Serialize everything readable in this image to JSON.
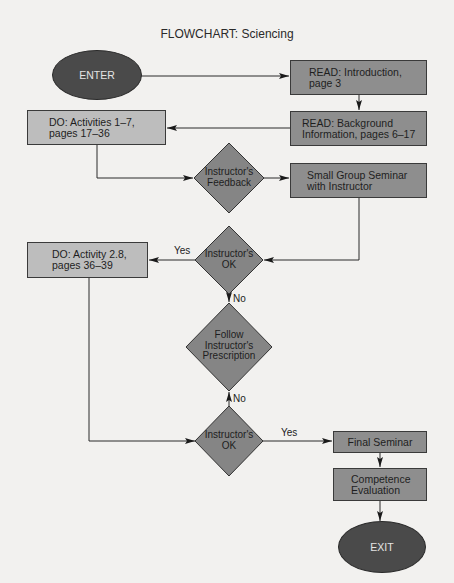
{
  "title": "FLOWCHART: Sciencing",
  "nodes": {
    "enter": {
      "type": "terminal",
      "label": "ENTER"
    },
    "read_intro": {
      "type": "process",
      "label": "READ: Introduction,\npage 3"
    },
    "read_background": {
      "type": "process",
      "label": "READ: Background\nInformation, pages 6–17"
    },
    "do_activities": {
      "type": "process",
      "label": "DO: Activities 1–7,\npages 17–36"
    },
    "feedback": {
      "type": "decision",
      "label": "Instructor's\nFeedback"
    },
    "small_group": {
      "type": "process",
      "label": "Small Group Seminar\nwith Instructor"
    },
    "ok1": {
      "type": "decision",
      "label": "Instructor's\nOK"
    },
    "do_activity_28": {
      "type": "process",
      "label": "DO: Activity 2.8,\npages 36–39"
    },
    "follow": {
      "type": "decision",
      "label": "Follow\nInstructor's\nPrescription"
    },
    "ok2": {
      "type": "decision",
      "label": "Instructor's\nOK"
    },
    "final_seminar": {
      "type": "process",
      "label": "Final Seminar"
    },
    "competence": {
      "type": "process",
      "label": "Competence\nEvaluation"
    },
    "exit": {
      "type": "terminal",
      "label": "EXIT"
    }
  },
  "edges": [
    {
      "from": "enter",
      "to": "read_intro",
      "label": ""
    },
    {
      "from": "read_intro",
      "to": "read_background",
      "label": ""
    },
    {
      "from": "read_background",
      "to": "do_activities",
      "label": ""
    },
    {
      "from": "do_activities",
      "to": "feedback",
      "label": ""
    },
    {
      "from": "feedback",
      "to": "small_group",
      "label": ""
    },
    {
      "from": "small_group",
      "to": "ok1",
      "label": ""
    },
    {
      "from": "ok1",
      "to": "do_activity_28",
      "label": "Yes"
    },
    {
      "from": "ok1",
      "to": "follow",
      "label": "No"
    },
    {
      "from": "follow",
      "to": "ok2",
      "label": "No"
    },
    {
      "from": "do_activity_28",
      "to": "ok2",
      "label": ""
    },
    {
      "from": "ok2",
      "to": "final_seminar",
      "label": "Yes"
    },
    {
      "from": "final_seminar",
      "to": "competence",
      "label": ""
    },
    {
      "from": "competence",
      "to": "exit",
      "label": ""
    }
  ],
  "edge_labels": {
    "ok1_yes": "Yes",
    "ok1_no": "No",
    "follow_no": "No",
    "ok2_yes": "Yes"
  },
  "colors": {
    "background": "#f2f1ef",
    "terminal_fill": "#4a4a4a",
    "process_dark_fill": "#8e8e8e",
    "process_light_fill": "#bdbdbd",
    "decision_fill": "#858585",
    "line": "#2a2a2a"
  }
}
